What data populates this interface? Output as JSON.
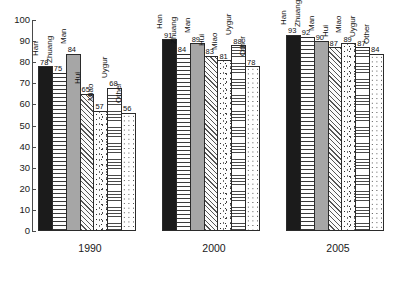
{
  "chart_data": {
    "type": "bar",
    "title": "",
    "subtitle": "",
    "xlabel": "",
    "ylabel": "",
    "ylim": [
      0,
      100
    ],
    "ytick_step": 10,
    "yticks": [
      0,
      10,
      20,
      30,
      40,
      50,
      60,
      70,
      80,
      90,
      100
    ],
    "grid": false,
    "legend_position": "none",
    "categories": [
      "1990",
      "2000",
      "2005"
    ],
    "group_label_position": "below-axis",
    "series": [
      {
        "name": "Han",
        "pattern": "solid-black",
        "values": [
          78,
          91,
          93
        ]
      },
      {
        "name": "Zhuang",
        "pattern": "brick-dash",
        "values": [
          75,
          84,
          92
        ]
      },
      {
        "name": "Man",
        "pattern": "solid-gray",
        "values": [
          84,
          89,
          90
        ]
      },
      {
        "name": "Hui",
        "pattern": "diagonal",
        "values": [
          65,
          83,
          87
        ]
      },
      {
        "name": "Miao",
        "pattern": "speckle",
        "values": [
          57,
          81,
          89
        ]
      },
      {
        "name": "Uygur",
        "pattern": "h-lines",
        "values": [
          68,
          88,
          87
        ]
      },
      {
        "name": "Other",
        "pattern": "dots",
        "values": [
          56,
          78,
          84
        ]
      }
    ],
    "groups": [
      {
        "label": "1990",
        "bars": [
          {
            "name": "Han",
            "value": 78,
            "pattern": "solid-black"
          },
          {
            "name": "Zhuang",
            "value": 75,
            "pattern": "brick-dash"
          },
          {
            "name": "Man",
            "value": 84,
            "pattern": "solid-gray"
          },
          {
            "name": "Hui",
            "value": 65,
            "pattern": "diagonal"
          },
          {
            "name": "Miao",
            "value": 57,
            "pattern": "speckle"
          },
          {
            "name": "Uygur",
            "value": 68,
            "pattern": "h-lines"
          },
          {
            "name": "Other",
            "value": 56,
            "pattern": "dots"
          }
        ]
      },
      {
        "label": "2000",
        "bars": [
          {
            "name": "Han",
            "value": 91,
            "pattern": "solid-black"
          },
          {
            "name": "Zhuang",
            "value": 84,
            "pattern": "brick-dash"
          },
          {
            "name": "Man",
            "value": 89,
            "pattern": "solid-gray"
          },
          {
            "name": "Hui",
            "value": 83,
            "pattern": "diagonal"
          },
          {
            "name": "Miao",
            "value": 81,
            "pattern": "speckle"
          },
          {
            "name": "Uygur",
            "value": 88,
            "pattern": "h-lines"
          },
          {
            "name": "Other",
            "value": 78,
            "pattern": "dots"
          }
        ]
      },
      {
        "label": "2005",
        "bars": [
          {
            "name": "Han",
            "value": 93,
            "pattern": "solid-black"
          },
          {
            "name": "Zhuang",
            "value": 92,
            "pattern": "brick-dash"
          },
          {
            "name": "Man",
            "value": 90,
            "pattern": "solid-gray"
          },
          {
            "name": "Hui",
            "value": 87,
            "pattern": "diagonal"
          },
          {
            "name": "Miao",
            "value": 89,
            "pattern": "speckle"
          },
          {
            "name": "Uygur",
            "value": 87,
            "pattern": "h-lines"
          },
          {
            "name": "Other",
            "value": 84,
            "pattern": "dots"
          }
        ]
      }
    ]
  },
  "colors": {
    "axis": "#4a4a4a",
    "text": "#1a1a1a",
    "bar_outline": "#2b2b2b",
    "background": "#ffffff",
    "series_black": "#1b1b1b",
    "series_gray": "#a6a6a6"
  }
}
